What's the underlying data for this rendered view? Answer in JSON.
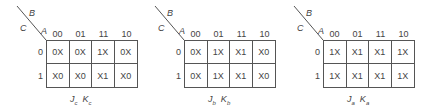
{
  "variables": {
    "b": "B",
    "c": "C",
    "a": "A"
  },
  "column_headers": [
    "00",
    "01",
    "11",
    "10"
  ],
  "row_headers": [
    "0",
    "1"
  ],
  "maps": [
    {
      "caption": {
        "j": "J",
        "j_sub": "c",
        "k": "K",
        "k_sub": "c"
      },
      "cells": [
        [
          "0X",
          "0X",
          "1X",
          "0X"
        ],
        [
          "X0",
          "X0",
          "X1",
          "X0"
        ]
      ]
    },
    {
      "caption": {
        "j": "J",
        "j_sub": "b",
        "k": "K",
        "k_sub": "b"
      },
      "cells": [
        [
          "0X",
          "1X",
          "X1",
          "X0"
        ],
        [
          "0X",
          "1X",
          "X1",
          "X0"
        ]
      ]
    },
    {
      "caption": {
        "j": "J",
        "j_sub": "a",
        "k": "K",
        "k_sub": "a"
      },
      "cells": [
        [
          "1X",
          "X1",
          "X1",
          "1X"
        ],
        [
          "1X",
          "X1",
          "X1",
          "1X"
        ]
      ]
    }
  ]
}
